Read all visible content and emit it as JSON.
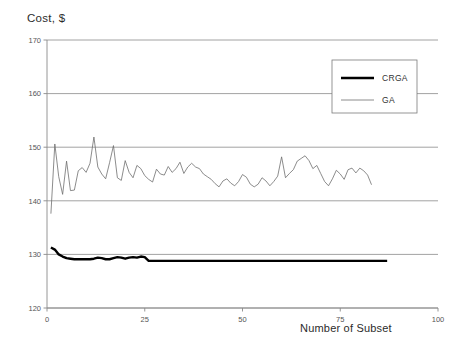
{
  "chart_data": {
    "type": "line",
    "title": "Cost, $",
    "xlabel": "Number of Subset",
    "ylabel": "Cost, $",
    "xlim": [
      0,
      100
    ],
    "ylim": [
      120,
      170
    ],
    "xticks": [
      0,
      25,
      50,
      75,
      100
    ],
    "yticks": [
      120,
      130,
      140,
      150,
      160,
      170
    ],
    "grid": "horizontal",
    "legend_position": "top-right",
    "series": [
      {
        "name": "CRGA",
        "color": "#000000",
        "linewidth": 2.4,
        "x": [
          1,
          2,
          3,
          4,
          5,
          6,
          7,
          8,
          9,
          10,
          11,
          12,
          13,
          14,
          15,
          16,
          17,
          18,
          19,
          20,
          21,
          22,
          23,
          24,
          25,
          26,
          27,
          28,
          29,
          30,
          31,
          32,
          33,
          34,
          35,
          36,
          37,
          38,
          39,
          40,
          41,
          42,
          43,
          44,
          45,
          46,
          47,
          48,
          49,
          50,
          51,
          52,
          53,
          54,
          55,
          56,
          57,
          58,
          59,
          60,
          61,
          62,
          63,
          64,
          65,
          66,
          67,
          68,
          69,
          70,
          71,
          72,
          73,
          74,
          75,
          76,
          77,
          78,
          79,
          80,
          81,
          82,
          83,
          84,
          85,
          86,
          87
        ],
        "values": [
          131.3,
          130.9,
          130.0,
          129.6,
          129.3,
          129.2,
          129.1,
          129.1,
          129.1,
          129.1,
          129.1,
          129.2,
          129.4,
          129.3,
          129.1,
          129.1,
          129.3,
          129.5,
          129.4,
          129.2,
          129.4,
          129.5,
          129.4,
          129.6,
          129.5,
          128.8,
          128.8,
          128.8,
          128.8,
          128.8,
          128.8,
          128.8,
          128.8,
          128.8,
          128.8,
          128.8,
          128.8,
          128.8,
          128.8,
          128.8,
          128.8,
          128.8,
          128.8,
          128.8,
          128.8,
          128.8,
          128.8,
          128.8,
          128.8,
          128.8,
          128.8,
          128.8,
          128.8,
          128.8,
          128.8,
          128.8,
          128.8,
          128.8,
          128.8,
          128.8,
          128.8,
          128.8,
          128.8,
          128.8,
          128.8,
          128.8,
          128.8,
          128.8,
          128.8,
          128.8,
          128.8,
          128.8,
          128.8,
          128.8,
          128.8,
          128.8,
          128.8,
          128.8,
          128.8,
          128.8,
          128.8,
          128.8,
          128.8,
          128.8,
          128.8,
          128.8,
          128.8
        ]
      },
      {
        "name": "GA",
        "color": "#6e6e6e",
        "linewidth": 0.8,
        "x": [
          1,
          2,
          3,
          4,
          5,
          6,
          7,
          8,
          9,
          10,
          11,
          12,
          13,
          14,
          15,
          16,
          17,
          18,
          19,
          20,
          21,
          22,
          23,
          24,
          25,
          26,
          27,
          28,
          29,
          30,
          31,
          32,
          33,
          34,
          35,
          36,
          37,
          38,
          39,
          40,
          41,
          42,
          43,
          44,
          45,
          46,
          47,
          48,
          49,
          50,
          51,
          52,
          53,
          54,
          55,
          56,
          57,
          58,
          59,
          60,
          61,
          62,
          63,
          64,
          65,
          66,
          67,
          68,
          69,
          70,
          71,
          72,
          73,
          74,
          75,
          76,
          77,
          78,
          79,
          80,
          81,
          82,
          83
        ],
        "values": [
          137.6,
          150.6,
          144.5,
          141.2,
          147.4,
          141.9,
          142.0,
          145.6,
          146.2,
          145.3,
          147.0,
          151.9,
          146.3,
          145.0,
          144.1,
          147.1,
          150.3,
          144.3,
          143.8,
          147.5,
          145.3,
          144.3,
          146.6,
          146.0,
          144.7,
          144.0,
          143.5,
          145.9,
          145.0,
          144.8,
          146.4,
          145.3,
          146.0,
          147.2,
          145.1,
          146.3,
          147.0,
          146.3,
          146.0,
          145.0,
          144.5,
          144.0,
          143.2,
          142.6,
          143.7,
          144.1,
          143.3,
          142.8,
          143.6,
          144.9,
          144.4,
          143.1,
          142.6,
          143.1,
          144.3,
          143.7,
          142.8,
          143.6,
          144.6,
          148.2,
          144.3,
          145.1,
          145.8,
          147.4,
          147.9,
          148.4,
          147.5,
          146.0,
          146.6,
          145.1,
          143.6,
          142.8,
          144.1,
          145.7,
          145.0,
          144.0,
          145.8,
          146.1,
          145.2,
          146.1,
          145.6,
          144.8,
          143.0
        ]
      }
    ],
    "legend": [
      {
        "label": "CRGA"
      },
      {
        "label": "GA"
      }
    ]
  }
}
